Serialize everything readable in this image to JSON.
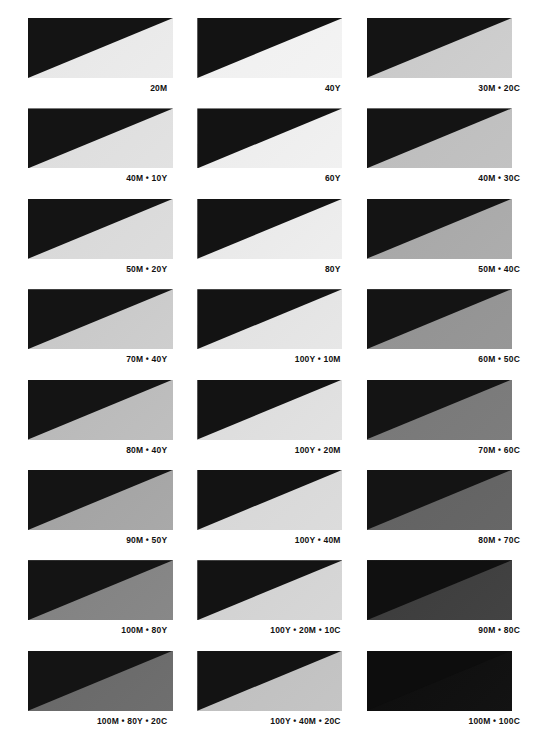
{
  "page": {
    "background_color": "#ffffff",
    "wedge_color": "#121212",
    "label_color": "#111111",
    "columns": 3,
    "rows": 8,
    "separator": " • "
  },
  "chart_data": {
    "type": "table",
    "xlabel": "",
    "ylabel": "",
    "grid": false,
    "legend": "none",
    "columns": [
      "Magenta / Yellow tints",
      "Yellow / Magenta tints",
      "Magenta / Cyan tints"
    ],
    "categories": [
      "20M",
      "40Y",
      "30M • 20C",
      "40M • 10Y",
      "60Y",
      "40M • 30C",
      "50M • 20Y",
      "80Y",
      "50M • 40C",
      "70M • 40Y",
      "100Y • 10M",
      "60M • 50C",
      "80M • 40Y",
      "100Y • 20M",
      "70M • 60C",
      "90M • 50Y",
      "100Y • 40M",
      "80M • 70C",
      "100M • 80Y",
      "100Y • 20M • 10C",
      "90M • 80C",
      "100M • 80Y • 20C",
      "100Y • 40M • 20C",
      "100M • 100C"
    ],
    "values": [
      88,
      93,
      78,
      84,
      91,
      72,
      82,
      89,
      63,
      77,
      86,
      55,
      72,
      84,
      46,
      63,
      82,
      38,
      50,
      80,
      24,
      40,
      74,
      5
    ],
    "value_unit": "relative lightness (0-100)"
  },
  "swatches": [
    {
      "label": "20M",
      "tone": "#e6e6e6",
      "tone_end": "#ececec",
      "wedge": "#141414"
    },
    {
      "label": "40Y",
      "tone": "#efefef",
      "tone_end": "#f3f3f3",
      "wedge": "#131313"
    },
    {
      "label": "30M • 20C",
      "tone": "#c8c8c8",
      "tone_end": "#cfcfcf",
      "wedge": "#141414"
    },
    {
      "label": "40M • 10Y",
      "tone": "#dcdcdc",
      "tone_end": "#e2e2e2",
      "wedge": "#141414"
    },
    {
      "label": "60Y",
      "tone": "#ebebeb",
      "tone_end": "#f1f1f1",
      "wedge": "#131313"
    },
    {
      "label": "40M • 30C",
      "tone": "#bcbcbc",
      "tone_end": "#c2c2c2",
      "wedge": "#141414"
    },
    {
      "label": "50M • 20Y",
      "tone": "#d7d7d7",
      "tone_end": "#dddddd",
      "wedge": "#141414"
    },
    {
      "label": "80Y",
      "tone": "#e7e7e7",
      "tone_end": "#eeeeee",
      "wedge": "#131313"
    },
    {
      "label": "50M • 40C",
      "tone": "#a6a6a6",
      "tone_end": "#adadad",
      "wedge": "#141414"
    },
    {
      "label": "70M • 40Y",
      "tone": "#c6c6c6",
      "tone_end": "#cecece",
      "wedge": "#141414"
    },
    {
      "label": "100Y • 10M",
      "tone": "#e0e0e0",
      "tone_end": "#e7e7e7",
      "wedge": "#131313"
    },
    {
      "label": "60M • 50C",
      "tone": "#919191",
      "tone_end": "#979797",
      "wedge": "#141414"
    },
    {
      "label": "80M • 40Y",
      "tone": "#b7b7b7",
      "tone_end": "#bfbfbf",
      "wedge": "#141414"
    },
    {
      "label": "100Y • 20M",
      "tone": "#dbdbdb",
      "tone_end": "#e2e2e2",
      "wedge": "#131313"
    },
    {
      "label": "70M • 60C",
      "tone": "#777777",
      "tone_end": "#7d7d7d",
      "wedge": "#141414"
    },
    {
      "label": "90M • 50Y",
      "tone": "#a1a1a1",
      "tone_end": "#a9a9a9",
      "wedge": "#141414"
    },
    {
      "label": "100Y • 40M",
      "tone": "#d6d6d6",
      "tone_end": "#dcdcdc",
      "wedge": "#131313"
    },
    {
      "label": "80M • 70C",
      "tone": "#616161",
      "tone_end": "#676767",
      "wedge": "#141414"
    },
    {
      "label": "100M • 80Y",
      "tone": "#808080",
      "tone_end": "#888888",
      "wedge": "#141414"
    },
    {
      "label": "100Y • 20M • 10C",
      "tone": "#d0d0d0",
      "tone_end": "#d7d7d7",
      "wedge": "#131313"
    },
    {
      "label": "90M • 80C",
      "tone": "#3b3b3b",
      "tone_end": "#434343",
      "wedge": "#101010"
    },
    {
      "label": "100M • 80Y • 20C",
      "tone": "#676767",
      "tone_end": "#6f6f6f",
      "wedge": "#141414"
    },
    {
      "label": "100Y • 40M • 20C",
      "tone": "#bebebe",
      "tone_end": "#c5c5c5",
      "wedge": "#131313"
    },
    {
      "label": "100M • 100C",
      "tone": "#0d0d0d",
      "tone_end": "#131313",
      "wedge": "#0d0d0d"
    }
  ]
}
